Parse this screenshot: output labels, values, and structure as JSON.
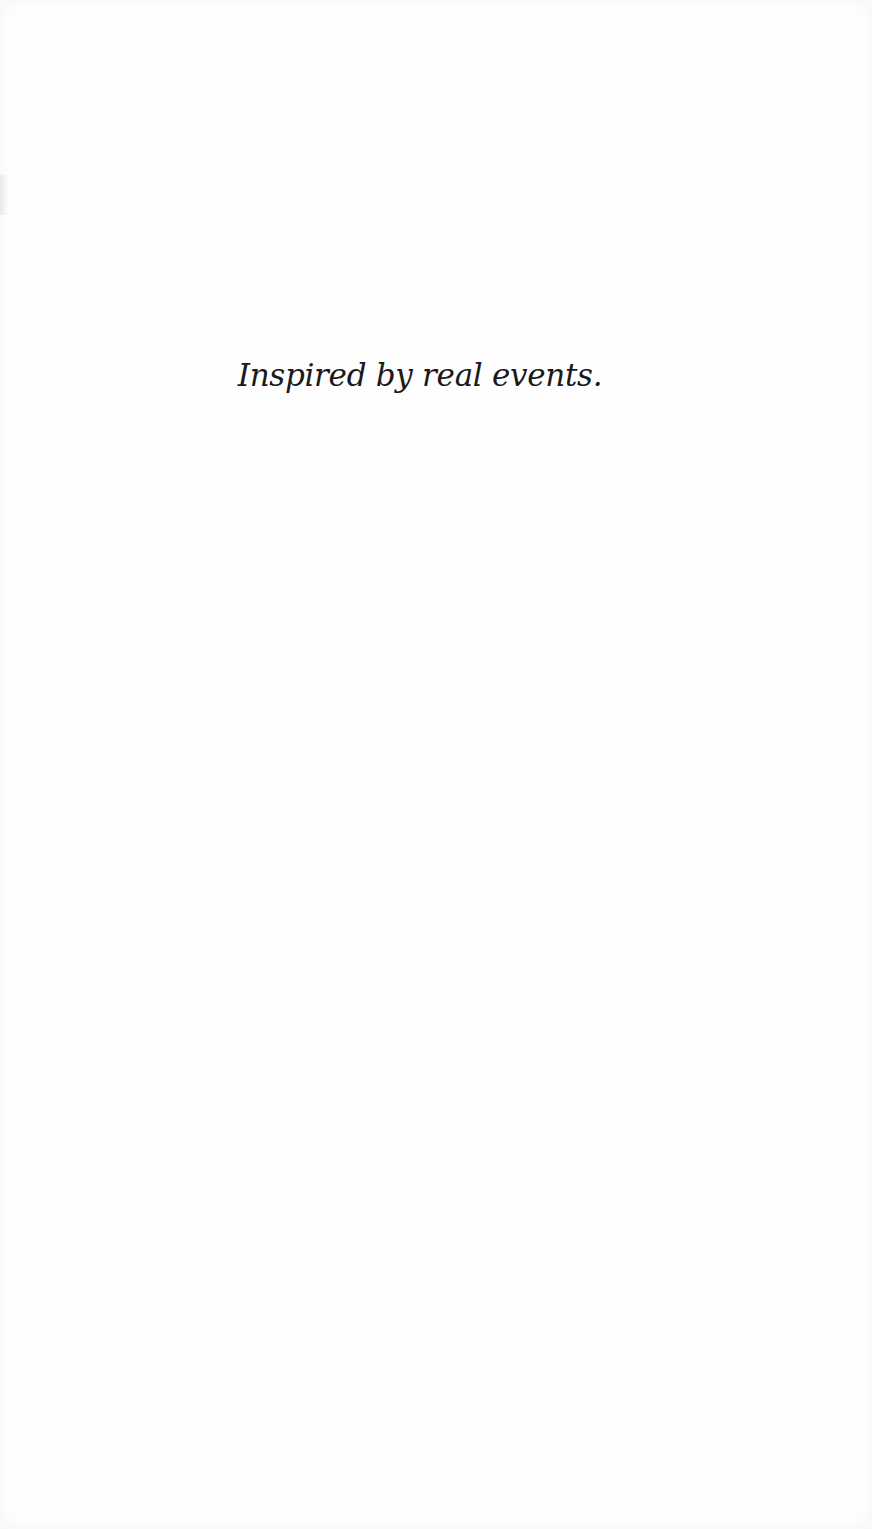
{
  "page": {
    "epigraph": "Inspired by real events."
  },
  "colors": {
    "background": "#fefefe",
    "text": "#1a1a1a"
  }
}
